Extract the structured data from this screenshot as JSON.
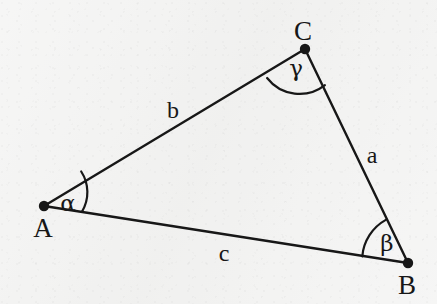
{
  "figure": {
    "kind": "triangle-diagram",
    "background_color": "#f3f3f2",
    "ink_color": "#171717",
    "stroke_width": 2,
    "vertex_dot_radius": 5,
    "width": 437,
    "height": 304
  },
  "vertices": [
    {
      "id": "A",
      "label": "A",
      "x": 44,
      "y": 206,
      "label_x": 43,
      "label_y": 228
    },
    {
      "id": "B",
      "label": "B",
      "x": 408,
      "y": 263,
      "label_x": 407,
      "label_y": 285
    },
    {
      "id": "C",
      "label": "C",
      "x": 305,
      "y": 49,
      "label_x": 303,
      "label_y": 31
    }
  ],
  "sides": [
    {
      "id": "a",
      "label": "a",
      "from": "B",
      "to": "C",
      "label_x": 372,
      "label_y": 155
    },
    {
      "id": "b",
      "label": "b",
      "from": "A",
      "to": "C",
      "label_x": 173,
      "label_y": 110
    },
    {
      "id": "c",
      "label": "c",
      "from": "A",
      "to": "B",
      "label_x": 224,
      "label_y": 253
    }
  ],
  "angles": [
    {
      "id": "alpha",
      "label": "α",
      "at_vertex": "A",
      "label_x": 68,
      "label_y": 203,
      "arc_radius": 38,
      "arc_path": "M 81.2 171.5 A 38 38 0 0 1 81.9 211.9"
    },
    {
      "id": "beta",
      "label": "β",
      "at_vertex": "B",
      "label_x": 387,
      "label_y": 243,
      "arc_radius": 46,
      "arc_path": "M 362.3 256.3 A 46 46 0 0 1 385.8 219.9"
    },
    {
      "id": "gamma",
      "label": "γ",
      "at_vertex": "C",
      "label_x": 296,
      "label_y": 68,
      "arc_radius": 41,
      "arc_path": "M 267.1 78.0 A 41 41 0 0 0 324.9 85.1"
    }
  ],
  "caption": {
    "alt": "Triangle ABC with sides a, b, c and interior angles alpha, beta, gamma"
  }
}
